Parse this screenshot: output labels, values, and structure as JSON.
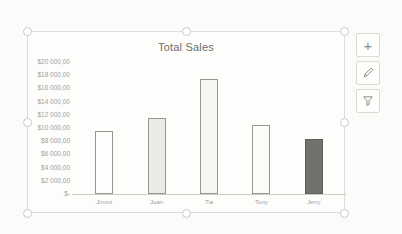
{
  "window": {
    "background": "#fbfbf9"
  },
  "chart": {
    "selected": true,
    "frame_color": "#dddddb"
  },
  "side_buttons": {
    "elements": {
      "icon": "plus-icon",
      "glyph": "+"
    },
    "styles": {
      "icon": "brush-icon"
    },
    "filters": {
      "icon": "funnel-icon"
    }
  },
  "chart_data": {
    "type": "bar",
    "title": "Total Sales",
    "categories": [
      "Jimmi",
      "Joan",
      "Tia",
      "Tony",
      "Jerry"
    ],
    "values": [
      9600,
      11500,
      17500,
      10400,
      8400
    ],
    "xlabel": "",
    "ylabel": "",
    "ylim": [
      0,
      20000
    ],
    "ytick_step": 2000,
    "ytick_labels_ascending": [
      "$-",
      "$2 000,00",
      "$4 000,00",
      "$6 000,00",
      "$8 000,00",
      "$10 000,00",
      "$12 000,00",
      "$14 000,00",
      "$16 000,00",
      "$18 000,00",
      "$20 000,00"
    ],
    "grid": false,
    "legend": false,
    "bar_fills": [
      "#fdfdfb",
      "#eaeae6",
      "#f5f5f2",
      "#fbfbf8",
      "#71716d"
    ],
    "bar_borders": [
      "#97978f",
      "#97978f",
      "#97978f",
      "#97978f",
      "#5e5e59"
    ],
    "title_color": "#6e6e6e",
    "axis_label_color": "#a0a09b"
  }
}
